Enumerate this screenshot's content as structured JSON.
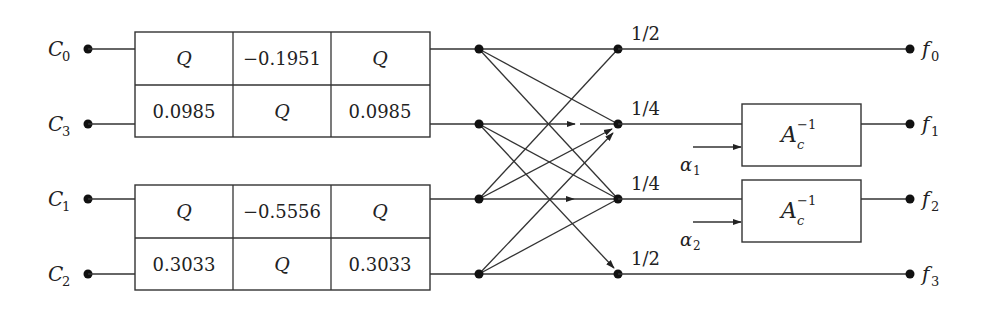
{
  "inputs": [
    {
      "label": "C",
      "sub": "0",
      "y": 49
    },
    {
      "label": "C",
      "sub": "3",
      "y": 124
    },
    {
      "label": "C",
      "sub": "1",
      "y": 199
    },
    {
      "label": "C",
      "sub": "2",
      "y": 274
    }
  ],
  "lifting_blocks": [
    {
      "top_row": [
        "Q",
        "−0.1951",
        "Q"
      ],
      "bottom_row": [
        "0.0985",
        "Q",
        "0.0985"
      ]
    },
    {
      "top_row": [
        "Q",
        "−0.5556",
        "Q"
      ],
      "bottom_row": [
        "0.3033",
        "Q",
        "0.3033"
      ]
    }
  ],
  "butterfly_gains": [
    "1/2",
    "1/4",
    "1/4",
    "1/2"
  ],
  "adaptive_blocks": [
    {
      "label": "A",
      "sub": "c",
      "sup": "−1",
      "param": "α",
      "param_sub": "1"
    },
    {
      "label": "A",
      "sub": "c",
      "sup": "−1",
      "param": "α",
      "param_sub": "2"
    }
  ],
  "outputs": [
    {
      "label": "f",
      "sub": "0"
    },
    {
      "label": "f",
      "sub": "1"
    },
    {
      "label": "f",
      "sub": "2"
    },
    {
      "label": "f",
      "sub": "3"
    }
  ]
}
